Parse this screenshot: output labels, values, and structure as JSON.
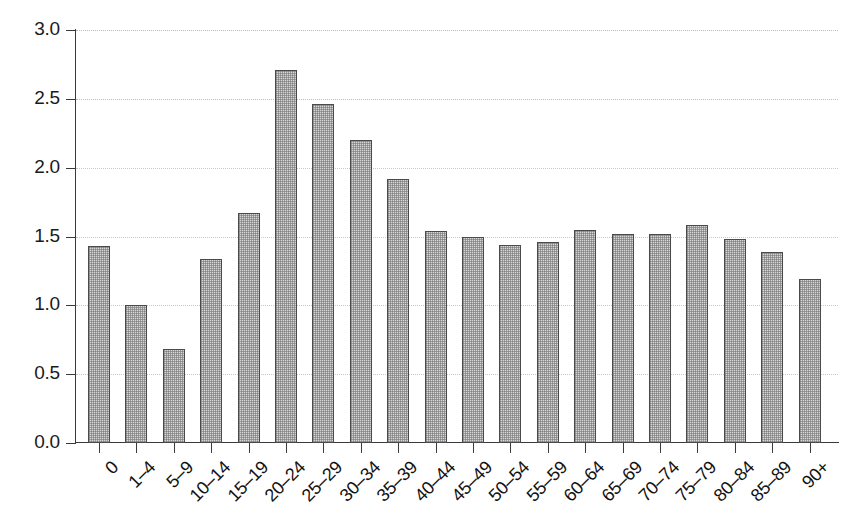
{
  "chart_data": {
    "type": "bar",
    "title": "",
    "subtitle": "",
    "xlabel": "",
    "ylabel": "",
    "categories": [
      "0",
      "1–4",
      "5–9",
      "10–14",
      "15–19",
      "20–24",
      "25–29",
      "30–34",
      "35–39",
      "40–44",
      "45–49",
      "50–54",
      "55–59",
      "60–64",
      "65–69",
      "70–74",
      "75–79",
      "80–84",
      "85–89",
      "90+"
    ],
    "values": [
      1.43,
      1.0,
      0.68,
      1.34,
      1.67,
      2.71,
      2.46,
      2.2,
      1.92,
      1.54,
      1.5,
      1.44,
      1.46,
      1.55,
      1.52,
      1.52,
      1.58,
      1.48,
      1.39,
      1.19
    ],
    "ylim": [
      0.0,
      3.0
    ],
    "ytick_values": [
      0.0,
      0.5,
      1.0,
      1.5,
      2.0,
      2.5,
      3.0
    ],
    "ytick_labels": [
      "0.0",
      "0.5",
      "1.0",
      "1.5",
      "2.0",
      "2.5",
      "3.0"
    ],
    "grid": true,
    "grid_axis": "y",
    "grid_style": "dotted",
    "legend": null,
    "legend_position": "none",
    "bar_fill_color": "#d6d6d6",
    "bar_edge_color": "#4a4a4a",
    "axis_color": "#3a3a3a",
    "grid_color": "#c9c9c9",
    "background_color": "#ffffff",
    "xtick_label_rotation": -45,
    "annotations": []
  }
}
